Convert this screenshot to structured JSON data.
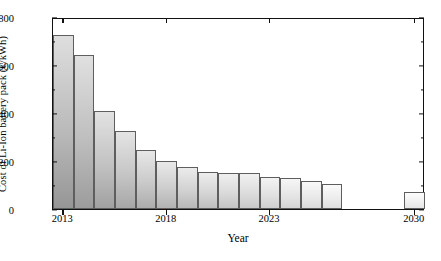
{
  "chart_data": {
    "type": "bar",
    "title": "",
    "xlabel": "Year",
    "ylabel": "Cost of Li-Ion battery pack (€/kWh)",
    "xlim": [
      2012.5,
      2030.5
    ],
    "ylim": [
      0,
      800
    ],
    "ytick_values": [
      0,
      200,
      400,
      600,
      800
    ],
    "ytick_labels": [
      "0",
      "200",
      "400",
      "600",
      "800"
    ],
    "yminor_tick_values": [
      100,
      300,
      500,
      700
    ],
    "xtick_values": [
      2013,
      2018,
      2023,
      2030
    ],
    "xtick_labels": [
      "2013",
      "2018",
      "2023",
      "2030"
    ],
    "grid": false,
    "legend": null,
    "categories": [
      2013,
      2014,
      2015,
      2016,
      2017,
      2018,
      2019,
      2020,
      2021,
      2022,
      2023,
      2024,
      2025,
      2026,
      2030
    ],
    "values": [
      725,
      640,
      410,
      325,
      245,
      200,
      175,
      155,
      150,
      152,
      135,
      130,
      118,
      105,
      72
    ],
    "bar_width_years": 1
  },
  "axes": {
    "ylabel": "Cost of Li-Ion battery pack (€/kWh)",
    "xlabel": "Year"
  }
}
